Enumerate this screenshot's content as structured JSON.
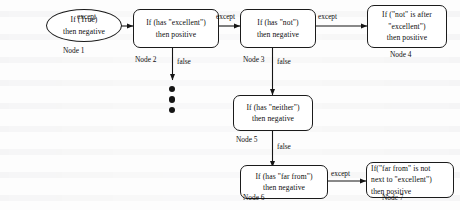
{
  "diagram": {
    "nodes": [
      {
        "id": "node1",
        "shape": "oval",
        "lines": [
          "If (True)",
          "then negative"
        ],
        "label": "Node 1"
      },
      {
        "id": "node2",
        "shape": "rounded-rect",
        "lines": [
          "If (has \"excellent\")",
          "then positive"
        ],
        "label": "Node 2"
      },
      {
        "id": "node3",
        "shape": "rounded-rect",
        "lines": [
          "If (has \"not\")",
          "then negative"
        ],
        "label": "Node 3"
      },
      {
        "id": "node4",
        "shape": "rounded-rect",
        "lines": [
          "If (\"not\" is after",
          "\"excellent\")",
          "then positive"
        ],
        "label": "Node 4"
      },
      {
        "id": "node5",
        "shape": "rounded-rect",
        "lines": [
          "If (has \"neither\")",
          "then negative"
        ],
        "label": "Node 5"
      },
      {
        "id": "node6",
        "shape": "rounded-rect",
        "lines": [
          "If (has \"far from\")",
          "then negative"
        ],
        "label": "Node 6"
      },
      {
        "id": "node7",
        "shape": "rounded-rect",
        "lines": [
          "If(\"far from\" is not",
          "next to \"excellent\")",
          "then positive"
        ],
        "label": "Node 7"
      }
    ],
    "edges": [
      {
        "id": "e1",
        "from": "node1",
        "to": "node2",
        "label": "except"
      },
      {
        "id": "e2",
        "from": "node2",
        "to": "node3",
        "label": "except"
      },
      {
        "id": "e3",
        "from": "node3",
        "to": "node4",
        "label": "except"
      },
      {
        "id": "e4",
        "from": "node2",
        "to": "ellipsis",
        "label": "false"
      },
      {
        "id": "e5",
        "from": "node3",
        "to": "node5",
        "label": "false"
      },
      {
        "id": "e6",
        "from": "node5",
        "to": "node6",
        "label": "false"
      },
      {
        "id": "e7",
        "from": "node6",
        "to": "node7",
        "label": "except"
      }
    ],
    "ellipsis": {
      "name": "vertical-ellipsis",
      "dots": 3
    },
    "colors": {
      "stroke": "#1b1b1b",
      "text": "#0d0d0d",
      "background": "#fdfdfd"
    }
  }
}
